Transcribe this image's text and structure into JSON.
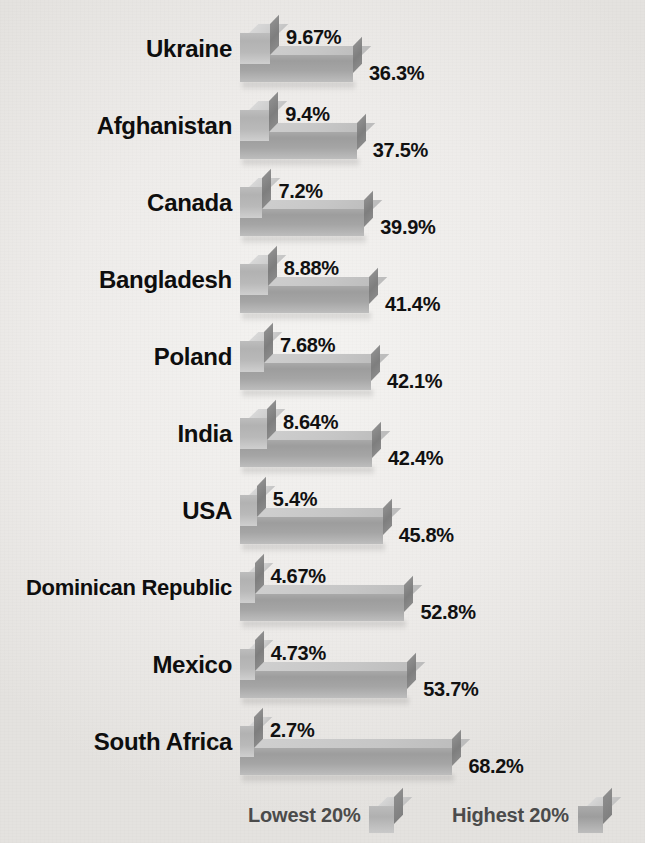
{
  "title": "Income in Select Nations",
  "legend": {
    "lowest_label": "Lowest 20%",
    "highest_label": "Highest 20%"
  },
  "colors": {
    "background": "#eceae7",
    "label_text": "#0e0e0e",
    "value_text": "#111111",
    "legend_text": "#4b4b4b",
    "bar_lowest_front": "#b9b9b9",
    "bar_lowest_top": "#cfcfcf",
    "bar_highest_front": "#a5a5a5",
    "bar_highest_top": "#c6c6c6",
    "bar_side": "#838383"
  },
  "chart_data": {
    "type": "bar",
    "title": "Income in Select Nations",
    "xlabel": "",
    "ylabel": "",
    "orientation": "horizontal",
    "grid": false,
    "legend_position": "bottom-right",
    "xlim": [
      0,
      70
    ],
    "categories": [
      "Ukraine",
      "Afghanistan",
      "Canada",
      "Bangladesh",
      "Poland",
      "India",
      "USA",
      "Dominican Republic",
      "Mexico",
      "South Africa"
    ],
    "series": [
      {
        "name": "Lowest 20%",
        "values": [
          9.67,
          9.4,
          7.2,
          8.88,
          7.68,
          8.64,
          5.4,
          4.67,
          4.73,
          2.7
        ],
        "labels": [
          "9.67%",
          "9.4%",
          "7.2%",
          "8.88%",
          "7.68%",
          "8.64%",
          "5.4%",
          "4.67%",
          "4.73%",
          "2.7%"
        ]
      },
      {
        "name": "Highest 20%",
        "values": [
          36.3,
          37.5,
          39.9,
          41.4,
          42.1,
          42.4,
          45.8,
          52.8,
          53.7,
          68.2
        ],
        "labels": [
          "36.3%",
          "37.5%",
          "39.9%",
          "41.4%",
          "42.1%",
          "42.4%",
          "45.8%",
          "52.8%",
          "53.7%",
          "68.2%"
        ]
      }
    ]
  }
}
